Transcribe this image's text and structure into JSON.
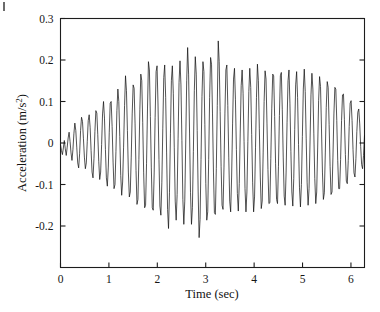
{
  "figure": {
    "background_color": "#ffffff",
    "line_color": "#101010",
    "axis_color": "#1d1d1d"
  },
  "chart_data": {
    "type": "line",
    "title": "",
    "subtitle": "",
    "xlabel": "Time (sec)",
    "ylabel": "Acceleration (m/s²)",
    "ylabel_base": "Acceleration (m/s",
    "ylabel_exponent": "2",
    "ylabel_close": ")",
    "xlim": [
      0,
      6.28
    ],
    "ylim": [
      -0.3,
      0.3
    ],
    "xticks": [
      0,
      1,
      2,
      3,
      4,
      5,
      6
    ],
    "xticklabels": [
      "0",
      "1",
      "2",
      "3",
      "4",
      "5",
      "6"
    ],
    "yticks": [
      -0.2,
      -0.1,
      0,
      0.1,
      0.2,
      0.3
    ],
    "yticklabels": [
      "-0.2",
      "-0.1",
      "0",
      "0.1",
      "0.2",
      "0.3"
    ],
    "grid": false,
    "legend": null,
    "legend_position": "none",
    "series": [
      {
        "name": "acceleration",
        "color": "#101010",
        "x_start": 0.0,
        "x_end": 6.28,
        "n_points": 315,
        "units_y": "m/s^2",
        "units_x": "sec",
        "peak_max": 0.245,
        "peak_min": -0.256,
        "values": [
          -0.004,
          -0.018,
          -0.028,
          -0.012,
          0.006,
          -0.014,
          -0.03,
          -0.01,
          0.012,
          0.026,
          0.004,
          -0.024,
          -0.042,
          -0.016,
          0.022,
          0.048,
          0.03,
          -0.01,
          -0.048,
          -0.06,
          -0.026,
          0.03,
          0.062,
          0.052,
          0.01,
          -0.034,
          -0.062,
          -0.048,
          0.004,
          0.054,
          0.068,
          0.038,
          -0.018,
          -0.07,
          -0.084,
          -0.038,
          0.028,
          0.078,
          0.072,
          0.02,
          -0.044,
          -0.088,
          -0.07,
          -0.004,
          0.07,
          0.1,
          0.06,
          -0.016,
          -0.084,
          -0.104,
          -0.058,
          0.026,
          0.096,
          0.1,
          0.04,
          -0.046,
          -0.11,
          -0.1,
          -0.02,
          0.078,
          0.13,
          0.1,
          0.016,
          -0.078,
          -0.126,
          -0.094,
          -0.01,
          0.09,
          0.162,
          0.126,
          0.03,
          -0.07,
          -0.13,
          -0.118,
          -0.034,
          0.07,
          0.14,
          0.132,
          0.046,
          -0.066,
          -0.148,
          -0.136,
          -0.04,
          0.08,
          0.166,
          0.15,
          0.05,
          -0.072,
          -0.156,
          -0.15,
          -0.05,
          0.082,
          0.196,
          0.176,
          0.064,
          -0.06,
          -0.156,
          -0.162,
          -0.07,
          0.062,
          0.172,
          0.186,
          0.094,
          -0.04,
          -0.152,
          -0.174,
          -0.096,
          0.034,
          0.158,
          0.188,
          0.11,
          -0.024,
          -0.16,
          -0.206,
          -0.12,
          0.022,
          0.15,
          0.186,
          0.12,
          -0.01,
          -0.14,
          -0.186,
          -0.124,
          0.01,
          0.146,
          0.198,
          0.14,
          0.006,
          -0.136,
          -0.196,
          -0.14,
          0.0,
          0.15,
          0.23,
          0.166,
          0.024,
          -0.12,
          -0.196,
          -0.156,
          -0.02,
          0.126,
          0.208,
          0.166,
          0.03,
          -0.118,
          -0.228,
          -0.184,
          -0.04,
          0.112,
          0.196,
          0.172,
          0.044,
          -0.098,
          -0.186,
          -0.166,
          -0.04,
          0.11,
          0.206,
          0.19,
          0.07,
          -0.07,
          -0.168,
          -0.172,
          -0.062,
          0.09,
          0.246,
          0.196,
          0.076,
          -0.056,
          -0.15,
          -0.16,
          -0.06,
          0.072,
          0.176,
          0.188,
          0.09,
          -0.034,
          -0.14,
          -0.166,
          -0.082,
          0.046,
          0.154,
          0.18,
          0.104,
          -0.016,
          -0.122,
          -0.164,
          -0.098,
          0.024,
          0.138,
          0.176,
          0.12,
          0.004,
          -0.11,
          -0.166,
          -0.118,
          0.004,
          0.124,
          0.18,
          0.134,
          0.02,
          -0.096,
          -0.166,
          -0.13,
          -0.01,
          0.11,
          0.19,
          0.15,
          0.034,
          -0.082,
          -0.158,
          -0.14,
          -0.024,
          0.1,
          0.174,
          0.154,
          0.046,
          -0.064,
          -0.146,
          -0.144,
          -0.038,
          0.084,
          0.166,
          0.162,
          0.064,
          -0.05,
          -0.136,
          -0.146,
          -0.056,
          0.066,
          0.162,
          0.17,
          0.08,
          -0.036,
          -0.128,
          -0.15,
          -0.07,
          0.05,
          0.15,
          0.176,
          0.096,
          -0.02,
          -0.118,
          -0.152,
          -0.086,
          0.032,
          0.14,
          0.172,
          0.11,
          -0.004,
          -0.108,
          -0.154,
          -0.1,
          0.016,
          0.13,
          0.178,
          0.124,
          0.01,
          -0.096,
          -0.15,
          -0.11,
          0.0,
          0.116,
          0.168,
          0.13,
          0.022,
          -0.086,
          -0.146,
          -0.118,
          -0.012,
          0.102,
          0.16,
          0.136,
          0.036,
          -0.07,
          -0.136,
          -0.12,
          -0.024,
          0.086,
          0.148,
          0.134,
          0.044,
          -0.056,
          -0.124,
          -0.118,
          -0.034,
          0.07,
          0.134,
          0.13,
          0.054,
          -0.042,
          -0.11,
          -0.11,
          -0.04,
          0.054,
          0.116,
          0.118,
          0.056,
          -0.028,
          -0.092,
          -0.098,
          -0.042,
          0.04,
          0.096,
          0.102,
          0.054,
          -0.016,
          -0.072,
          -0.082,
          -0.038,
          0.028,
          0.074,
          0.082,
          0.046,
          -0.008,
          -0.052,
          -0.062,
          -0.03,
          0.018
        ]
      }
    ]
  }
}
